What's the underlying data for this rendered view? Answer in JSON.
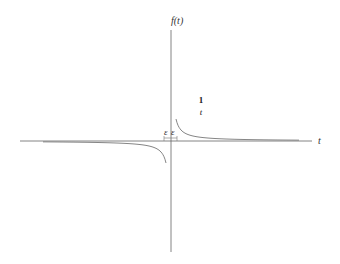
{
  "chart_data": {
    "type": "line",
    "title": "",
    "function": "1/t",
    "xlabel": "t",
    "ylabel": "f(t)",
    "annotation": {
      "numerator": "1",
      "denominator": "t"
    },
    "epsilon_labels": [
      "ε",
      "ε"
    ],
    "grid": false,
    "series": [
      {
        "name": "1/t (t>0)",
        "x": [
          0.1,
          0.15,
          0.2,
          0.3,
          0.5,
          1,
          2,
          4,
          8
        ],
        "y": [
          10,
          6.67,
          5,
          3.33,
          2,
          1,
          0.5,
          0.25,
          0.125
        ]
      },
      {
        "name": "1/t (t<0)",
        "x": [
          -8,
          -4,
          -2,
          -1,
          -0.5,
          -0.3,
          -0.2,
          -0.15,
          -0.1
        ],
        "y": [
          -0.125,
          -0.25,
          -0.5,
          -1,
          -2,
          -3.33,
          -5,
          -6.67,
          -10
        ]
      }
    ]
  },
  "labels": {
    "y_axis": "f(t)",
    "x_axis": "t",
    "numerator": "1",
    "denominator": "t",
    "eps_left": "ε",
    "eps_right": "ε"
  }
}
